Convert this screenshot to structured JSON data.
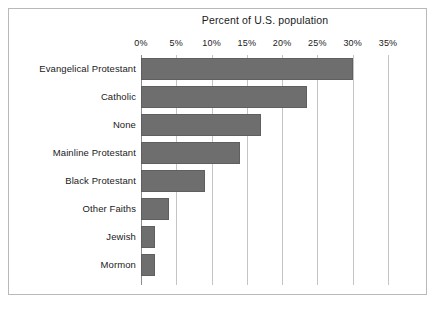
{
  "figure": {
    "background_color": "#ffffff",
    "frame_color": "#b9b9b9"
  },
  "chart_data": {
    "type": "bar",
    "orientation": "horizontal",
    "title": "Percent of U.S. population",
    "xlabel": "",
    "ylabel": "",
    "xlim": [
      0,
      35
    ],
    "xticks": [
      0,
      5,
      10,
      15,
      20,
      25,
      30,
      35
    ],
    "xtick_labels": [
      "0%",
      "5%",
      "10%",
      "15%",
      "20%",
      "25%",
      "30%",
      "35%"
    ],
    "grid": true,
    "grid_axis": "x",
    "legend": false,
    "bar_color": "#6e6e6e",
    "bar_edge_color": "#5f5f5f",
    "grid_color": "#c4c4c4",
    "categories": [
      "Evangelical Protestant",
      "Catholic",
      "None",
      "Mainline Protestant",
      "Black Protestant",
      "Other Faiths",
      "Jewish",
      "Mormon"
    ],
    "values": [
      30,
      23.5,
      17,
      14,
      9,
      4,
      2,
      2
    ],
    "value_unit": "percent"
  }
}
